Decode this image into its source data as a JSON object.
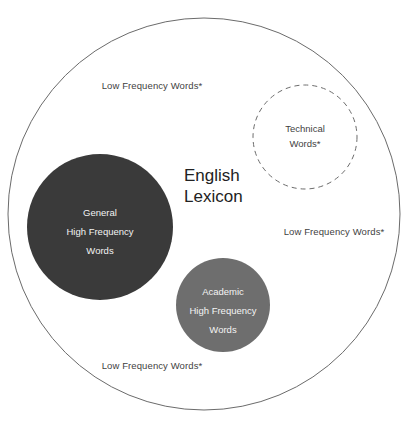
{
  "diagram": {
    "title_label": "English\nLexicon",
    "title_line1": "English",
    "title_line2": "Lexicon",
    "colors": {
      "background": "#ffffff",
      "outer_stroke": "#6b6b6b",
      "dashed_stroke": "#6b6b6b",
      "general_circle_fill": "#3a3a3a",
      "academic_circle_fill": "#6e6e6e",
      "dark_text": "#3f3f3f",
      "light_text": "#f2f2f2",
      "title_text": "#222222"
    },
    "outer_circle": {
      "name": "English Lexicon",
      "cx": 204,
      "cy": 214,
      "r": 196
    },
    "outer_labels": [
      {
        "id": "low-frequency-top",
        "text": "Low Frequency Words*"
      },
      {
        "id": "low-frequency-right",
        "text": "Low Frequency Words*"
      },
      {
        "id": "low-frequency-bottom",
        "text": "Low Frequency Words*"
      }
    ],
    "dashed_circle": {
      "id": "technical-words",
      "cx": 305,
      "cy": 137,
      "r": 52,
      "line1": "Technical",
      "line2": "Words*",
      "dash": "5 4"
    },
    "general_circle": {
      "id": "general-high-frequency-words",
      "cx": 100,
      "cy": 227,
      "r": 73,
      "line1": "General",
      "line2": "High Frequency",
      "line3": "Words"
    },
    "academic_circle": {
      "id": "academic-high-frequency-words",
      "cx": 223,
      "cy": 305,
      "r": 47,
      "line1": "Academic",
      "line2": "High Frequency",
      "line3": "Words"
    }
  }
}
